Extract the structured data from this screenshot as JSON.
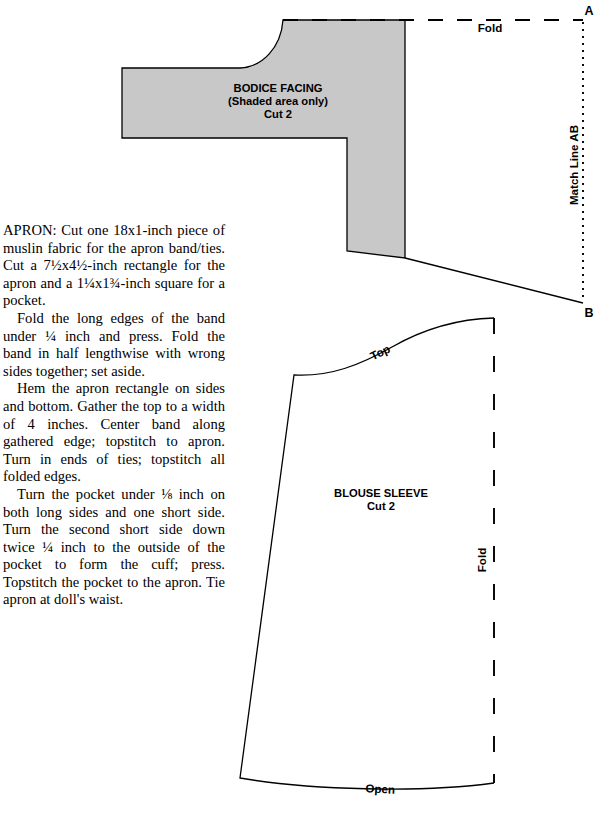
{
  "document": {
    "type": "sewing-pattern-sheet",
    "background_color": "#ffffff",
    "shaded_fill_color": "#c8c8c8",
    "line_color": "#000000"
  },
  "instructions": {
    "paragraphs": [
      "APRON: Cut one 18x1-inch piece of muslin fabric for the apron band/ties. Cut a 7½x4½-inch rectangle for the apron and a 1¼x1¾-inch square for a pocket.",
      "Fold the long edges of the band under ¼ inch and press. Fold the band in half lengthwise with wrong sides together; set aside.",
      "Hem the apron rectangle on sides and bottom. Gather the top to a width of 4 inches. Center band along gathered edge; topstitch to apron. Turn in ends of ties; topstitch all folded edges.",
      "Turn the pocket under ⅛ inch on both long sides and one short side. Turn the second short side down twice ¼ inch to the outside of the pocket to form the cuff; press. Topstitch the pocket to the apron. Tie apron at doll's waist."
    ]
  },
  "bodice_facing": {
    "title": "BODICE FACING",
    "subtitle": "(Shaded area only)",
    "cut": "Cut 2",
    "fold_label": "Fold",
    "match_line_label": "Match Line AB",
    "point_a": "A",
    "point_b": "B"
  },
  "blouse_sleeve": {
    "title": "BLOUSE SLEEVE",
    "cut": "Cut 2",
    "top_label": "Top",
    "fold_label": "Fold",
    "open_label": "Open"
  }
}
